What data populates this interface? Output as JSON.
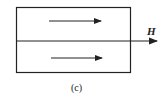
{
  "diagram": {
    "field_label": "H",
    "caption": "(c)",
    "colors": {
      "stroke": "#222222",
      "background": "#ffffff"
    },
    "elements": [
      {
        "type": "rectangle",
        "name": "domain-box"
      },
      {
        "type": "line",
        "name": "domain-wall",
        "note": "horizontal divider extending right as field arrow"
      },
      {
        "type": "arrow",
        "name": "upper-magnetization",
        "direction": "right"
      },
      {
        "type": "arrow",
        "name": "lower-magnetization",
        "direction": "right"
      }
    ]
  }
}
